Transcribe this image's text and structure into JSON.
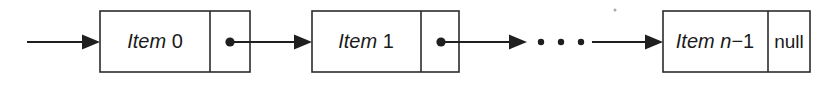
{
  "diagram": {
    "type": "linked-list",
    "background_color": "#ffffff",
    "stroke_color": "#2b2b2b",
    "ink_color": "#1f1f1f",
    "nodes": [
      {
        "id": "node-0",
        "label_italic": "Item",
        "label_upright": " 0",
        "pointer": "dot",
        "pointer_target": "node-1",
        "box": {
          "x": 100,
          "y": 11,
          "width": 150,
          "height": 61
        },
        "divider_x": 210
      },
      {
        "id": "node-1",
        "label_italic": "Item",
        "label_upright": " 1",
        "pointer": "dot",
        "pointer_target": "ellipsis",
        "box": {
          "x": 312,
          "y": 11,
          "width": 147,
          "height": 61
        },
        "divider_x": 421
      },
      {
        "id": "node-n",
        "label_italic": "Item n",
        "label_upright": "−1",
        "pointer": "null",
        "pointer_label": "null",
        "pointer_target": null,
        "box": {
          "x": 663,
          "y": 11,
          "width": 147,
          "height": 61
        },
        "divider_x": 768
      }
    ],
    "ellipsis": {
      "glyph": "• • •",
      "dot_count": 3,
      "dots_x": [
        541,
        561,
        581
      ],
      "y": 42
    },
    "arrows": [
      {
        "name": "head-arrow",
        "from_x": 27,
        "to_x": 100,
        "y": 42,
        "label": ""
      },
      {
        "name": "arrow-node0-to-node1",
        "from_x": 230,
        "to_x": 312,
        "y": 42,
        "label": ""
      },
      {
        "name": "arrow-node1-to-ellipsis",
        "from_x": 441,
        "to_x": 527,
        "y": 42,
        "label": ""
      },
      {
        "name": "arrow-ellipsis-to-noden",
        "from_x": 592,
        "to_x": 663,
        "y": 42,
        "label": ""
      }
    ],
    "pointer_dots": [
      {
        "name": "pointer-dot-node0",
        "cx": 230,
        "cy": 42,
        "r": 4.6
      },
      {
        "name": "pointer-dot-node1",
        "cx": 441,
        "cy": 42,
        "r": 4.6
      }
    ],
    "baseline_y": 42
  }
}
